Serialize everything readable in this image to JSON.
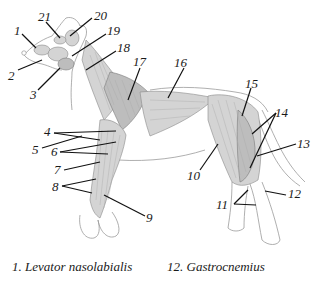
{
  "diagram": {
    "labels": [
      {
        "id": "1",
        "text": "1",
        "x": 14,
        "y": 30
      },
      {
        "id": "2",
        "text": "2",
        "x": 11,
        "y": 72
      },
      {
        "id": "3",
        "text": "3",
        "x": 32,
        "y": 91
      },
      {
        "id": "4",
        "text": "4",
        "x": 45,
        "y": 127
      },
      {
        "id": "5",
        "text": "5",
        "x": 34,
        "y": 143
      },
      {
        "id": "6",
        "text": "6",
        "x": 52,
        "y": 148
      },
      {
        "id": "7",
        "text": "7",
        "x": 55,
        "y": 166
      },
      {
        "id": "8",
        "text": "8",
        "x": 53,
        "y": 182
      },
      {
        "id": "9",
        "text": "9",
        "x": 147,
        "y": 213
      },
      {
        "id": "10",
        "text": "10",
        "x": 189,
        "y": 172
      },
      {
        "id": "11",
        "text": "11",
        "x": 216,
        "y": 199
      },
      {
        "id": "12",
        "text": "12",
        "x": 288,
        "y": 189
      },
      {
        "id": "13",
        "text": "13",
        "x": 297,
        "y": 141
      },
      {
        "id": "14",
        "text": "14",
        "x": 274,
        "y": 108
      },
      {
        "id": "15",
        "text": "15",
        "x": 246,
        "y": 82
      },
      {
        "id": "16",
        "text": "16",
        "x": 175,
        "y": 58
      },
      {
        "id": "17",
        "text": "17",
        "x": 135,
        "y": 58
      },
      {
        "id": "18",
        "text": "18",
        "x": 117,
        "y": 43
      },
      {
        "id": "19",
        "text": "19",
        "x": 107,
        "y": 28
      },
      {
        "id": "20",
        "text": "20",
        "x": 94,
        "y": 11
      },
      {
        "id": "21",
        "text": "21",
        "x": 38,
        "y": 12
      }
    ]
  },
  "legend": [
    {
      "number": "1.",
      "name": "Levator nasolabialis"
    },
    {
      "number": "12.",
      "name": "Gastrocnemius"
    }
  ]
}
